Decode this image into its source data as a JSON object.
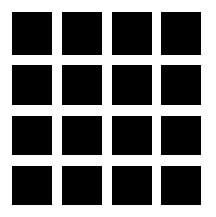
{
  "grid": {
    "rows": 4,
    "cols": 4,
    "cell_color": "#000000",
    "background": "#ffffff",
    "col_positions": [
      [
        12,
        40
      ],
      [
        62,
        40
      ],
      [
        112,
        40
      ],
      [
        161,
        40
      ]
    ],
    "row_positions": [
      [
        12,
        43
      ],
      [
        65,
        40
      ],
      [
        116,
        39
      ],
      [
        166,
        39
      ]
    ]
  }
}
